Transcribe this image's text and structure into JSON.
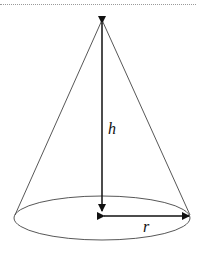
{
  "diagram": {
    "labels": {
      "height": "h",
      "radius": "r"
    },
    "colors": {
      "stroke": "#222222",
      "separator": "#9a9a9a"
    }
  }
}
